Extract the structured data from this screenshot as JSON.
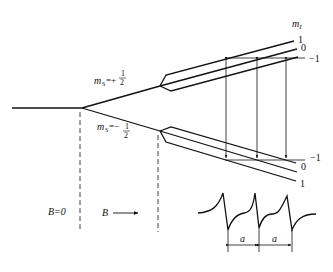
{
  "diagram": {
    "type": "ESR energy level splitting with hyperfine interaction",
    "field_labels": {
      "zero_field": "B=0",
      "field": "B"
    },
    "electron_spin_levels": [
      {
        "label_prefix": "m",
        "label_sub": "S",
        "label_eq": "=+",
        "numerator": "1",
        "denominator": "2"
      },
      {
        "label_prefix": "m",
        "label_sub": "S",
        "label_eq": "=−",
        "numerator": "1",
        "denominator": "2"
      }
    ],
    "nuclear_spin_header": {
      "prefix": "m",
      "sub": "I"
    },
    "upper_mI_labels": [
      "1",
      "0",
      "−1"
    ],
    "lower_mI_labels": [
      "−1",
      "0",
      "1"
    ],
    "spectrum": {
      "description": "Three-line derivative ESR spectrum",
      "lines": 3,
      "spacing_label": "a"
    },
    "colors": {
      "line": "#111111",
      "background": "#ffffff"
    }
  }
}
